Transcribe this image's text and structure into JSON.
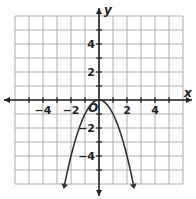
{
  "chart_data": {
    "type": "line",
    "title": "",
    "xlabel": "x",
    "ylabel": "y",
    "origin_label": "O",
    "xlim": [
      -6,
      6
    ],
    "ylim": [
      -6,
      6
    ],
    "grid": true,
    "x_ticks": [
      -4,
      -2,
      2,
      4
    ],
    "y_ticks": [
      4,
      2,
      -2,
      -4
    ],
    "x_tick_labels": [
      "−4",
      "−2",
      "2",
      "4"
    ],
    "y_tick_labels": [
      "4",
      "2",
      "−2",
      "−4"
    ],
    "series": [
      {
        "name": "parabola",
        "equation": "y = -x^2",
        "x": [
          -2.5,
          -2,
          -1.5,
          -1,
          -0.5,
          0,
          0.5,
          1,
          1.5,
          2,
          2.5
        ],
        "y": [
          -6.25,
          -4,
          -2.25,
          -1,
          -0.25,
          0,
          -0.25,
          -1,
          -2.25,
          -4,
          -6.25
        ],
        "arrows_at_ends": true
      }
    ]
  },
  "colors": {
    "grid": "#9a9a9a",
    "axis": "#222222",
    "curve": "#333333"
  }
}
